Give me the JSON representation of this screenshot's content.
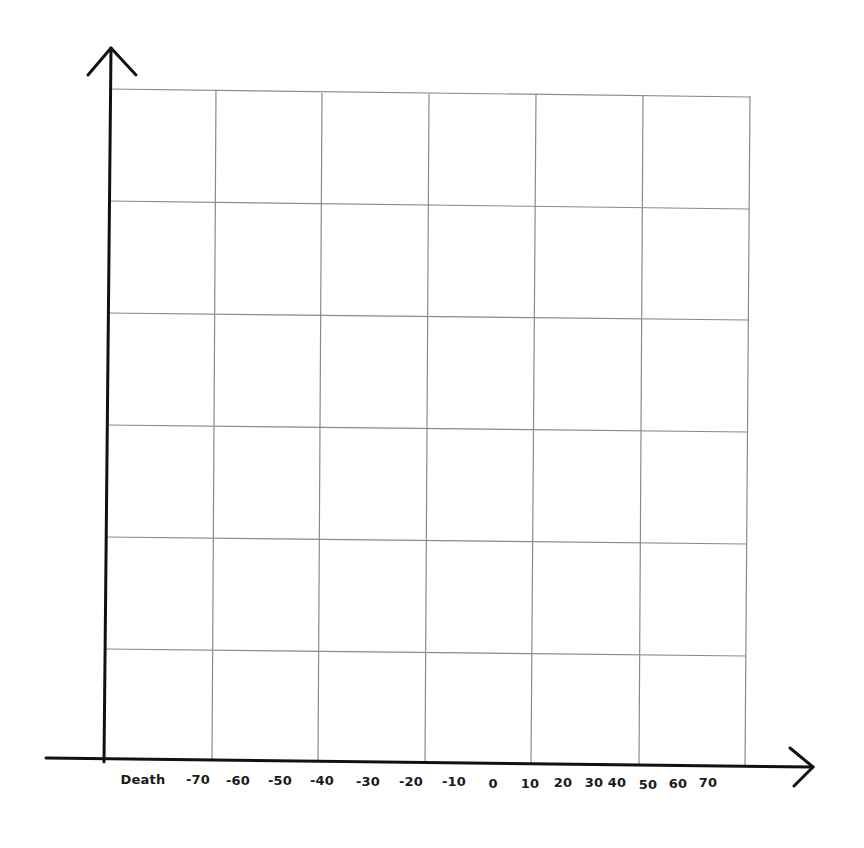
{
  "chart_data": {
    "type": "line",
    "title": "",
    "xlabel": "",
    "ylabel": "",
    "x_tick_labels": [
      "Death",
      "-70",
      "-60",
      "-50",
      "-40",
      "-30",
      "-20",
      "-10",
      "0",
      "10",
      "20",
      "30",
      "40",
      "50",
      "60",
      "70"
    ],
    "y_tick_labels": [],
    "grid": true,
    "grid_columns": 6,
    "grid_rows": 6,
    "series": []
  },
  "colors": {
    "axis": "#111111",
    "grid": "#8a8a8a",
    "background": "#ffffff",
    "label": "#1a1a1a"
  },
  "labels": [
    {
      "text": "Death",
      "x": 143,
      "y": 772
    },
    {
      "text": "-70",
      "x": 198,
      "y": 772
    },
    {
      "text": "-60",
      "x": 238,
      "y": 773
    },
    {
      "text": "-50",
      "x": 280,
      "y": 773
    },
    {
      "text": "-40",
      "x": 322,
      "y": 773
    },
    {
      "text": "-30",
      "x": 368,
      "y": 774
    },
    {
      "text": "-20",
      "x": 411,
      "y": 774
    },
    {
      "text": "-10",
      "x": 454,
      "y": 774
    },
    {
      "text": "0",
      "x": 493,
      "y": 776
    },
    {
      "text": "10",
      "x": 530,
      "y": 776
    },
    {
      "text": "20",
      "x": 563,
      "y": 775
    },
    {
      "text": "30",
      "x": 594,
      "y": 775
    },
    {
      "text": "40",
      "x": 617,
      "y": 775
    },
    {
      "text": "50",
      "x": 648,
      "y": 777
    },
    {
      "text": "60",
      "x": 678,
      "y": 776
    },
    {
      "text": "70",
      "x": 708,
      "y": 775
    }
  ]
}
